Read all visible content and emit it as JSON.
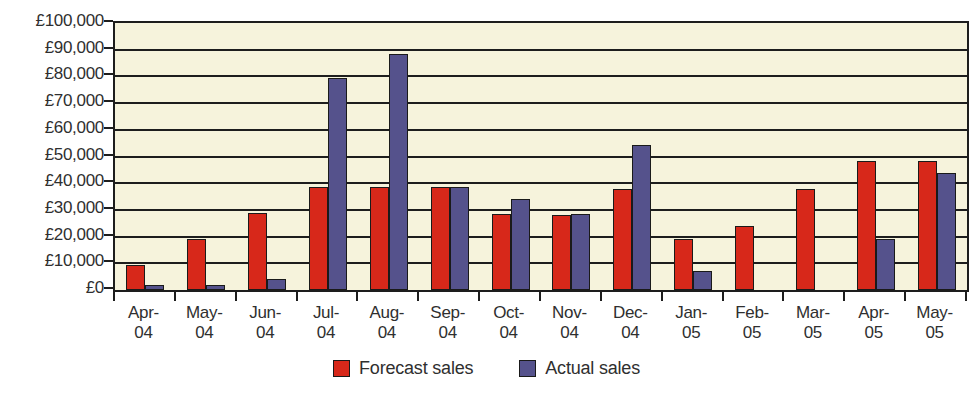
{
  "chart_data": {
    "type": "bar",
    "title": "",
    "xlabel": "",
    "ylabel": "",
    "ylim": [
      0,
      100000
    ],
    "grid": true,
    "legend_position": "bottom",
    "categories": [
      "Apr-04",
      "May-04",
      "Jun-04",
      "Jul-04",
      "Aug-04",
      "Sep-04",
      "Oct-04",
      "Nov-04",
      "Dec-04",
      "Jan-05",
      "Feb-05",
      "Mar-05",
      "Apr-05",
      "May-05"
    ],
    "category_lines": [
      {
        "line1": "Apr-",
        "line2": "04"
      },
      {
        "line1": "May-",
        "line2": "04"
      },
      {
        "line1": "Jun-",
        "line2": "04"
      },
      {
        "line1": "Jul-",
        "line2": "04"
      },
      {
        "line1": "Aug-",
        "line2": "04"
      },
      {
        "line1": "Sep-",
        "line2": "04"
      },
      {
        "line1": "Oct-",
        "line2": "04"
      },
      {
        "line1": "Nov-",
        "line2": "04"
      },
      {
        "line1": "Dec-",
        "line2": "04"
      },
      {
        "line1": "Jan-",
        "line2": "05"
      },
      {
        "line1": "Feb-",
        "line2": "05"
      },
      {
        "line1": "Mar-",
        "line2": "05"
      },
      {
        "line1": "Apr-",
        "line2": "05"
      },
      {
        "line1": "May-",
        "line2": "05"
      }
    ],
    "series": [
      {
        "name": "Forecast sales",
        "color": "#d7281a",
        "values": [
          9500,
          19000,
          29000,
          38500,
          38500,
          38500,
          28500,
          28000,
          38000,
          19000,
          24000,
          38000,
          48500,
          48500
        ]
      },
      {
        "name": "Actual sales",
        "color": "#55528c",
        "values": [
          2000,
          2000,
          4000,
          79500,
          88500,
          38500,
          34000,
          28500,
          54500,
          7000,
          0,
          0,
          19000,
          44000
        ]
      }
    ],
    "y_ticks": [
      {
        "value": 100000,
        "label": "£100,000"
      },
      {
        "value": 90000,
        "label": "£90,000"
      },
      {
        "value": 80000,
        "label": "£80,000"
      },
      {
        "value": 70000,
        "label": "£70,000"
      },
      {
        "value": 60000,
        "label": "£60,000"
      },
      {
        "value": 50000,
        "label": "£50,000"
      },
      {
        "value": 40000,
        "label": "£40,000"
      },
      {
        "value": 30000,
        "label": "£30,000"
      },
      {
        "value": 20000,
        "label": "£20,000"
      },
      {
        "value": 10000,
        "label": "£10,000"
      },
      {
        "value": 0,
        "label": "£0"
      }
    ]
  },
  "legend": {
    "items": [
      {
        "label": "Forecast sales",
        "color": "#d7281a",
        "key": "forecast"
      },
      {
        "label": "Actual sales",
        "color": "#55528c",
        "key": "actual"
      }
    ]
  },
  "colors": {
    "plot_background": "#f6f3dc",
    "page_background": "#ffffff",
    "axis": "#1d1d1d",
    "forecast": "#d7281a",
    "actual": "#55528c"
  }
}
